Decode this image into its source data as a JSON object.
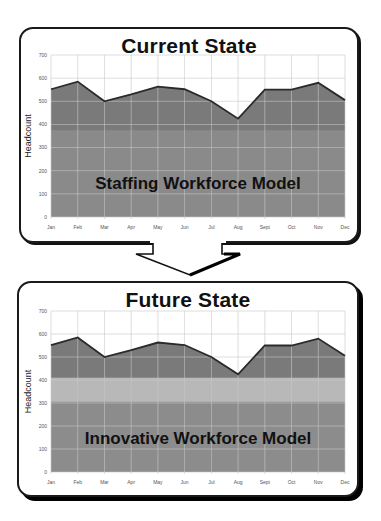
{
  "chart_data": [
    {
      "type": "area",
      "title": "Current State",
      "xlabel": "",
      "ylabel": "Headcount",
      "ylim": [
        0,
        700
      ],
      "yticks": [
        0,
        100,
        200,
        300,
        400,
        500,
        600,
        700
      ],
      "grid": true,
      "categories": [
        "Jan",
        "Feb",
        "Mar",
        "Apr",
        "May",
        "Jun",
        "Jul",
        "Aug",
        "Sept",
        "Oct",
        "Nov",
        "Dec"
      ],
      "series": [
        {
          "name": "Headcount",
          "values": [
            552,
            585,
            500,
            530,
            563,
            552,
            500,
            425,
            550,
            550,
            580,
            505
          ]
        }
      ],
      "bands": [
        {
          "name": "Base staffing",
          "from": 0,
          "to": 375,
          "color": "#8a8a8a"
        }
      ],
      "annotation": "Staffing Workforce Model",
      "colors": {
        "upper_fill": "#7a7a7a",
        "lower_fill": "#8c8c8c",
        "line": "#2a2a2a",
        "grid": "#c9c9c9"
      }
    },
    {
      "type": "area",
      "title": "Future State",
      "xlabel": "",
      "ylabel": "Headcount",
      "ylim": [
        0,
        700
      ],
      "yticks": [
        0,
        100,
        200,
        300,
        400,
        500,
        600,
        700
      ],
      "grid": true,
      "categories": [
        "Jan",
        "Feb",
        "Mar",
        "Apr",
        "May",
        "Jun",
        "Jul",
        "Aug",
        "Sept",
        "Oct",
        "Nov",
        "Dec"
      ],
      "series": [
        {
          "name": "Headcount",
          "values": [
            552,
            585,
            500,
            530,
            563,
            552,
            500,
            425,
            550,
            550,
            580,
            505
          ]
        }
      ],
      "bands": [
        {
          "name": "Core",
          "from": 0,
          "to": 305,
          "color": "#8c8c8c"
        },
        {
          "name": "Flexible",
          "from": 305,
          "to": 410,
          "color": "#b8b8b8"
        }
      ],
      "annotation": "Innovative Workforce Model",
      "colors": {
        "upper_fill": "#7a7a7a",
        "lower_fill": "#8c8c8c",
        "band_fill": "#b8b8b8",
        "line": "#2a2a2a",
        "grid": "#c9c9c9"
      }
    }
  ]
}
